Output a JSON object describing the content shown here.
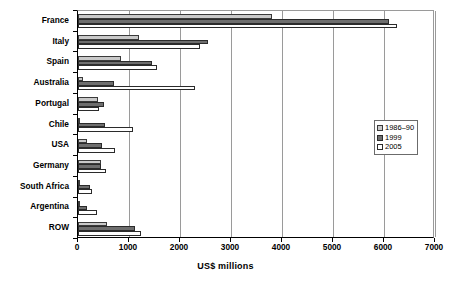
{
  "chart_data": {
    "type": "bar",
    "orientation": "horizontal",
    "title": "",
    "xlabel": "US$ millions",
    "ylabel": "",
    "xlim": [
      0,
      7000
    ],
    "xticks": [
      0,
      1000,
      2000,
      3000,
      4000,
      5000,
      6000,
      7000
    ],
    "xtick_labels": [
      "0",
      "1000",
      "2000",
      "3000",
      "4000",
      "5000",
      "6000",
      "7000"
    ],
    "grid": true,
    "grid_axis": "x",
    "legend_position": "right-middle",
    "categories": [
      "France",
      "Italy",
      "Spain",
      "Australia",
      "Portugal",
      "Chile",
      "USA",
      "Germany",
      "South Africa",
      "Argentina",
      "ROW"
    ],
    "series": [
      {
        "name": "1986–90",
        "color": "#c9c9c9",
        "values": [
          3800,
          1200,
          850,
          100,
          400,
          30,
          170,
          450,
          25,
          20,
          570
        ]
      },
      {
        "name": "1999",
        "color": "#6e6e6e",
        "values": [
          6100,
          2550,
          1450,
          700,
          500,
          530,
          480,
          460,
          230,
          180,
          1120
        ]
      },
      {
        "name": "2005",
        "color": "#ffffff",
        "values": [
          6250,
          2400,
          1550,
          2300,
          420,
          1080,
          730,
          540,
          270,
          380,
          1230
        ]
      }
    ]
  },
  "axis": {
    "x_title": "US$ millions"
  }
}
